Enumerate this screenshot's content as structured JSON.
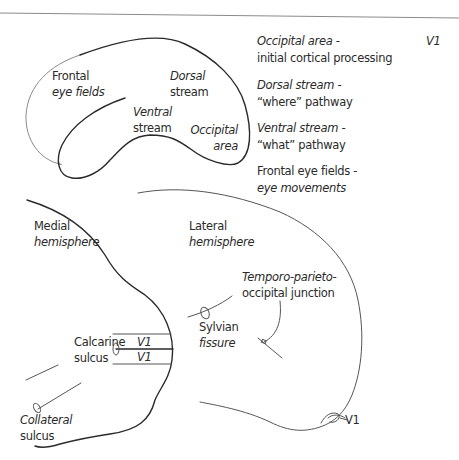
{
  "top_diagram": {
    "title": "Lateral view - visual streams",
    "labels": {
      "frontal_eye_fields": [
        "Frontal",
        "eye fields"
      ],
      "dorsal_stream": [
        "Dorsal",
        "stream"
      ],
      "ventral_stream": [
        "Ventral",
        "stream"
      ],
      "occipital_area": [
        "Occipital",
        "area"
      ]
    }
  },
  "legend": {
    "items": [
      {
        "term": "Occipital area -",
        "description": "initial cortical processing"
      },
      {
        "term": "Dorsal stream -",
        "description": "“where” pathway"
      },
      {
        "term": "Ventral stream -",
        "description": "“what” pathway"
      },
      {
        "term": "Frontal eye fields -",
        "description": "eye movements"
      }
    ],
    "corner_label": "V1"
  },
  "medial_hemisphere": {
    "title": [
      "Medial",
      "hemisphere"
    ],
    "calcarine_sulcus": [
      "Calcarine",
      "sulcus"
    ],
    "v1_upper": "V1",
    "v1_lower": "V1",
    "collateral_sulcus": [
      "Collateral",
      "sulcus"
    ]
  },
  "lateral_hemisphere": {
    "title": [
      "Lateral",
      "hemisphere"
    ],
    "tpo_junction": [
      "Temporo-parieto-",
      "occipital junction"
    ],
    "sylvian_fissure": [
      "Sylvian",
      "fissure"
    ],
    "v1_pole": "V1"
  },
  "colors": {
    "line": "#2a2a2a",
    "text": "#2b2b2b",
    "rule": "#9a9a9a",
    "background": "#ffffff"
  }
}
